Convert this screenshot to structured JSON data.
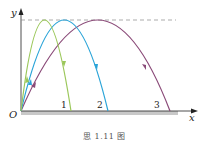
{
  "figure": {
    "caption": "思 1.11 图",
    "axes": {
      "x_label": "x",
      "y_label": "y",
      "origin_label": "O"
    },
    "max_height_line": "dashed",
    "trajectories": [
      {
        "name": "trajectory-1",
        "landing_label": "1",
        "color": "#9bc75a"
      },
      {
        "name": "trajectory-2",
        "landing_label": "2",
        "color": "#2aa4d8"
      },
      {
        "name": "trajectory-3",
        "landing_label": "3",
        "color": "#8a4a78"
      }
    ],
    "colors": {
      "ground": "#c8c8c8",
      "axis": "#222222",
      "dashed_line": "#888888"
    }
  }
}
